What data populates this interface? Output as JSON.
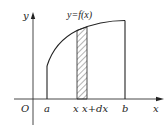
{
  "diagram": {
    "axes": {
      "x_label": "x",
      "y_label": "y",
      "origin_label": "O"
    },
    "function_label": "y=f(x)",
    "bounds": {
      "lower": "a",
      "upper": "b"
    },
    "strip": {
      "left_label": "x",
      "right_label": "x+dx",
      "fill": "hatched"
    },
    "colors": {
      "stroke": "#222222",
      "background": "#ffffff"
    }
  }
}
